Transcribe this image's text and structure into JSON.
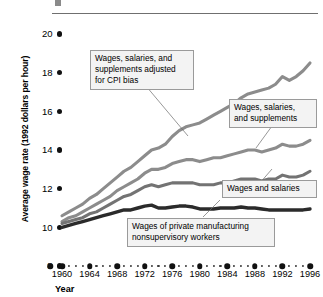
{
  "header": {
    "ghost_text_left": "",
    "ghost_text_right": ""
  },
  "chart_data": {
    "type": "line",
    "title": "",
    "xlabel": "Year",
    "ylabel": "Average wage rate (1992 dollars per hour)",
    "xlim": [
      1959,
      1997
    ],
    "ylim": [
      8,
      20
    ],
    "grid": false,
    "legend_position": "inline-callouts",
    "ytick_labels": [
      "20",
      "18",
      "16",
      "14",
      "12",
      "10",
      "8"
    ],
    "ytick_values": [
      20,
      18,
      16,
      14,
      12,
      10,
      8
    ],
    "xtick_labels": [
      "1960",
      "1964",
      "1968",
      "1972",
      "1976",
      "1980",
      "1984",
      "1988",
      "1992",
      "1996"
    ],
    "xtick_values": [
      1960,
      1964,
      1968,
      1972,
      1976,
      1980,
      1984,
      1988,
      1992,
      1996
    ],
    "x": [
      1960,
      1961,
      1962,
      1963,
      1964,
      1965,
      1966,
      1967,
      1968,
      1969,
      1970,
      1971,
      1972,
      1973,
      1974,
      1975,
      1976,
      1977,
      1978,
      1979,
      1980,
      1981,
      1982,
      1983,
      1984,
      1985,
      1986,
      1987,
      1988,
      1989,
      1990,
      1991,
      1992,
      1993,
      1994,
      1995,
      1996
    ],
    "series": [
      {
        "name": "Wages, salaries, and supplements adjusted for CPI bias",
        "color": "#8c8c8c",
        "values": [
          10.6,
          10.8,
          11.0,
          11.2,
          11.5,
          11.7,
          12.0,
          12.3,
          12.6,
          12.9,
          13.1,
          13.4,
          13.7,
          14.0,
          14.1,
          14.3,
          14.7,
          15.0,
          15.2,
          15.3,
          15.4,
          15.6,
          15.8,
          16.0,
          16.2,
          16.4,
          16.7,
          16.9,
          17.0,
          17.1,
          17.2,
          17.4,
          17.8,
          17.6,
          17.8,
          18.1,
          18.5
        ]
      },
      {
        "name": "Wages, salaries, and supplements",
        "color": "#8c8c8c",
        "values": [
          10.3,
          10.5,
          10.6,
          10.8,
          11.0,
          11.2,
          11.4,
          11.6,
          11.9,
          12.1,
          12.3,
          12.5,
          12.8,
          13.0,
          13.0,
          13.1,
          13.3,
          13.4,
          13.5,
          13.5,
          13.4,
          13.5,
          13.6,
          13.6,
          13.7,
          13.8,
          13.9,
          14.0,
          14.0,
          13.9,
          14.0,
          14.1,
          14.3,
          14.2,
          14.2,
          14.3,
          14.5
        ]
      },
      {
        "name": "Wages and salaries",
        "color": "#737373",
        "values": [
          10.2,
          10.3,
          10.4,
          10.5,
          10.7,
          10.8,
          11.0,
          11.2,
          11.4,
          11.6,
          11.7,
          11.9,
          12.1,
          12.2,
          12.1,
          12.2,
          12.3,
          12.3,
          12.3,
          12.3,
          12.2,
          12.2,
          12.2,
          12.3,
          12.3,
          12.4,
          12.5,
          12.5,
          12.5,
          12.4,
          12.5,
          12.5,
          12.7,
          12.6,
          12.6,
          12.7,
          12.9
        ]
      },
      {
        "name": "Wages of private manufacturing nonsupervisory workers",
        "color": "#2b2b2b",
        "values": [
          10.0,
          10.1,
          10.2,
          10.3,
          10.4,
          10.5,
          10.6,
          10.7,
          10.8,
          10.9,
          10.9,
          11.0,
          11.1,
          11.15,
          11.0,
          11.0,
          11.05,
          11.1,
          11.1,
          11.05,
          10.95,
          10.95,
          10.95,
          11.0,
          11.0,
          11.0,
          11.05,
          11.0,
          11.0,
          10.95,
          10.9,
          10.9,
          10.9,
          10.9,
          10.9,
          10.9,
          10.95
        ]
      }
    ],
    "annotations": [
      {
        "id": "cpi",
        "text": "Wages, salaries, and\nsupplements adjusted\nfor CPI bias"
      },
      {
        "id": "supp",
        "text": "Wages, salaries,\nand supplements"
      },
      {
        "id": "wagesal",
        "text": "Wages and salaries"
      },
      {
        "id": "nonsup",
        "text": "Wages of private manufacturing\nnonsupervisory workers"
      }
    ]
  }
}
